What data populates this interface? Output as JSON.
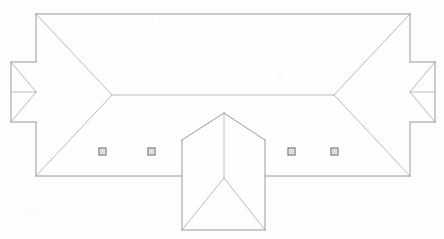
{
  "drawing": {
    "title": "Roof Plan",
    "type": "architectural-roof-plan",
    "view": "plan",
    "canvas": {
      "width": 444,
      "height": 239
    },
    "background_color": "#fdfdfd",
    "line_color": "#8e8e93",
    "hip_line_color": "#a7a7ab",
    "ridge_line_color": "#adadb2",
    "marker_color": "#5a5a5e"
  },
  "geometry": {
    "main_body": {
      "name": "main-hip-roof",
      "outline": "36,14 410,14 410,176 36,176",
      "left": 36,
      "top": 14,
      "right": 410,
      "bottom": 176,
      "ridge": {
        "x1": 112,
        "y1": 95,
        "x2": 334,
        "y2": 95
      },
      "hips": [
        "36,14 112,95",
        "36,176 112,95",
        "410,14 334,95",
        "410,176 334,95"
      ]
    },
    "left_wing": {
      "name": "left-wing-hip-roof",
      "outline": "11,62 36,62 36,122 11,122",
      "left": 11,
      "top": 62,
      "right": 36,
      "bottom": 122,
      "ridge": {
        "x1": 11,
        "y1": 92,
        "x2": 36,
        "y2": 92
      },
      "hips": [
        "11,62 36,92",
        "11,122 36,92",
        "11,62 11,92",
        "11,122 11,92"
      ]
    },
    "right_wing": {
      "name": "right-wing-hip-roof",
      "outline": "410,62 435,62 435,122 410,122",
      "left": 410,
      "top": 62,
      "right": 435,
      "bottom": 122,
      "ridge": {
        "x1": 410,
        "y1": 92,
        "x2": 435,
        "y2": 92
      },
      "hips": [
        "435,62 410,92",
        "435,122 410,92",
        "435,62 435,92",
        "435,122 435,92"
      ]
    },
    "center_projection": {
      "name": "center-porch-hip-roof",
      "outline": "182,113 265,113 265,230 182,230",
      "left": 182,
      "top": 113,
      "right": 265,
      "bottom": 230,
      "peak": {
        "x": 224,
        "y": 113
      },
      "junction": {
        "x": 224,
        "y": 178
      },
      "ridge": {
        "x1": 224,
        "y1": 113,
        "x2": 224,
        "y2": 178
      },
      "hips": [
        "182,140 224,113",
        "265,140 224,113",
        "182,230 224,178",
        "265,230 224,178"
      ],
      "side_edges": [
        "182,140 182,230",
        "265,140 265,230"
      ],
      "gable_edges": [
        "182,140 224,113",
        "265,140 224,113"
      ]
    }
  },
  "markers": {
    "name": "roof-vent-markers",
    "label": "vent",
    "count": 4,
    "size": 7,
    "items": [
      {
        "id": "vent-1",
        "x": 102,
        "y": 151
      },
      {
        "id": "vent-2",
        "x": 151,
        "y": 151
      },
      {
        "id": "vent-3",
        "x": 291,
        "y": 151
      },
      {
        "id": "vent-4",
        "x": 334,
        "y": 151
      }
    ]
  }
}
